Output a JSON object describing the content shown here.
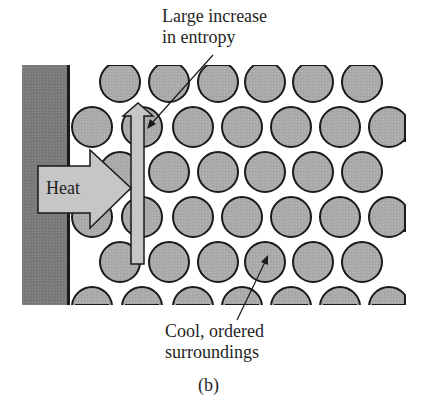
{
  "figure": {
    "caption": "(b)",
    "labels": {
      "entropy_line1": "Large increase",
      "entropy_line2": "in entropy",
      "cool_line1": "Cool, ordered",
      "cool_line2": "surroundings",
      "heat": "Heat"
    },
    "colors": {
      "wall": "#7a7a7a",
      "wall_edge": "#1a1a1a",
      "particle_fill": "#a9a9a9",
      "particle_stroke": "#1a1a1a",
      "arrow_fill": "#c4c4c4",
      "background": "#ffffff"
    },
    "lattice": {
      "rows": 6,
      "radius": 20,
      "odd_row_x": [
        120,
        169,
        218,
        265,
        313,
        362
      ],
      "even_row_x": [
        92,
        142,
        193,
        242,
        291,
        340,
        389
      ],
      "row_y": [
        82,
        127,
        172,
        217,
        262,
        307
      ]
    }
  }
}
